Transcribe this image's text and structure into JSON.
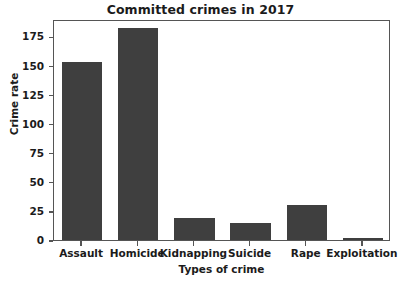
{
  "chart_data": {
    "type": "bar",
    "title": "Committed crimes in 2017",
    "xlabel": "Types of crime",
    "ylabel": "Crime rate",
    "categories": [
      "Assault",
      "Homicide",
      "Kidnapping",
      "Suicide",
      "Rape",
      "Exploitation"
    ],
    "values": [
      153,
      182,
      19,
      15,
      30,
      2
    ],
    "ylim": [
      0,
      190
    ],
    "yticks": [
      0,
      25,
      50,
      75,
      100,
      125,
      150,
      175
    ],
    "ytick_labels": [
      "0",
      "25",
      "50",
      "75",
      "100",
      "125",
      "150",
      "175"
    ],
    "grid": false,
    "legend": null,
    "bar_color": "#3f3f3f",
    "axis_color": "#555555",
    "background_color": "#ffffff",
    "text_color": "#1b1b1b"
  }
}
